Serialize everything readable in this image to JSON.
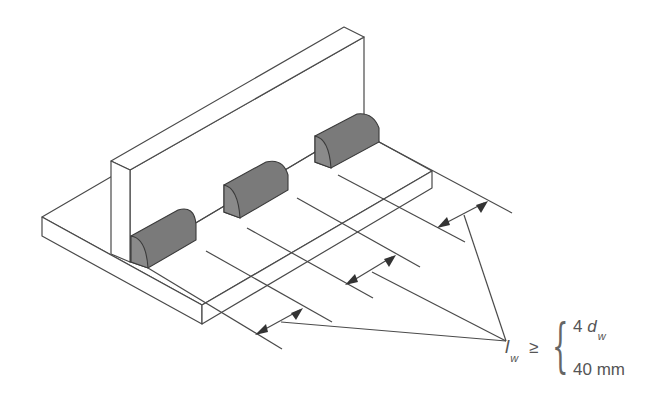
{
  "figure": {
    "label": {
      "symbol": "l",
      "subscript": "w",
      "relation": "≥",
      "conditions": [
        {
          "coefficient": "4",
          "variable": "d",
          "subscript": "w"
        },
        {
          "text": "40 mm"
        }
      ]
    },
    "weld_count": 3,
    "dimension_arrows": 3,
    "colors": {
      "line": "#4a4a4a",
      "weld": "#7a7a7a",
      "text": "#555555",
      "background": "#ffffff"
    }
  }
}
